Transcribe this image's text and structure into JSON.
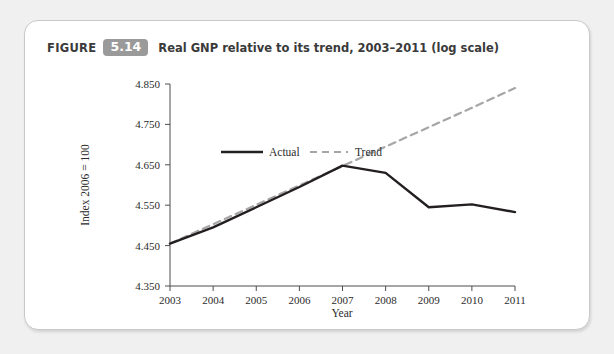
{
  "figure": {
    "label": "FIGURE",
    "number": "5.14",
    "title": "Real GNP relative to its trend, 2003–2011 (log scale)"
  },
  "colors": {
    "card_background": "#ffffff",
    "page_background": "#f0f0f0",
    "badge": "#9a9a9a",
    "actual_line": "#231f20",
    "trend_line": "#a6a6a6",
    "axis": "#4d4d4d"
  },
  "chart_data": {
    "type": "line",
    "title": "Real GNP relative to its trend, 2003–2011 (log scale)",
    "xlabel": "Year",
    "ylabel": "Index 2006 = 100",
    "x": [
      2003,
      2004,
      2005,
      2006,
      2007,
      2008,
      2009,
      2010,
      2011
    ],
    "categories": [
      "2003",
      "2004",
      "2005",
      "2006",
      "2007",
      "2008",
      "2009",
      "2010",
      "2011"
    ],
    "xlim": [
      2003,
      2011
    ],
    "ylim": [
      4.35,
      4.85
    ],
    "yticks": [
      "4.350",
      "4.450",
      "4.550",
      "4.650",
      "4.750",
      "4.850"
    ],
    "ytick_values": [
      4.35,
      4.45,
      4.55,
      4.65,
      4.75,
      4.85
    ],
    "grid": false,
    "legend_position": "upper-left-inside",
    "series": [
      {
        "name": "Actual",
        "style": "solid",
        "color": "#231f20",
        "values": [
          4.455,
          4.495,
          4.545,
          4.595,
          4.648,
          4.63,
          4.545,
          4.552,
          4.533
        ]
      },
      {
        "name": "Trend",
        "style": "dashed",
        "color": "#a6a6a6",
        "values": [
          4.455,
          4.503,
          4.551,
          4.599,
          4.647,
          4.695,
          4.743,
          4.791,
          4.84
        ]
      }
    ]
  },
  "legend": {
    "items": [
      {
        "label": "Actual",
        "style": "solid"
      },
      {
        "label": "Trend",
        "style": "dashed"
      }
    ]
  }
}
